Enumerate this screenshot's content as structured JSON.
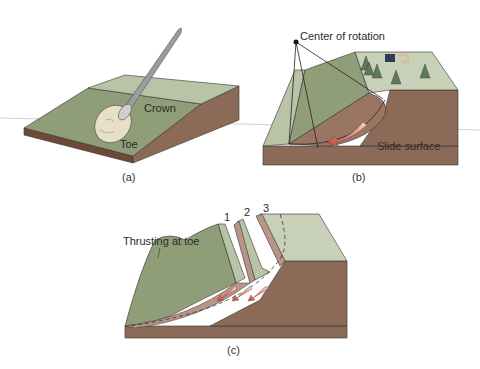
{
  "panels": [
    {
      "id": "a",
      "caption": "(a)",
      "labels": {
        "crown": "Crown",
        "toe": "Toe"
      },
      "description": "Spoon scooping material from a sloped block"
    },
    {
      "id": "b",
      "caption": "(b)",
      "labels": {
        "center": "Center of rotation",
        "slide": "Slide surface"
      },
      "description": "Rotational slump block with curved slide surface, trees and house on top"
    },
    {
      "id": "c",
      "caption": "(c)",
      "labels": {
        "thrust": "Thrusting at toe",
        "block1": "1",
        "block2": "2",
        "block3": "3"
      },
      "description": "Multiple slump blocks with successive curved slide surfaces"
    }
  ],
  "colors": {
    "surface_green": "#8f9e78",
    "light_green": "#b9c3a6",
    "pale_green": "#c8d1b8",
    "earth_brown": "#8b6b58",
    "dark_brown": "#6e4a36",
    "pink_slump": "#b89585",
    "arrow_red": "#c0463a",
    "line": "#333333"
  }
}
